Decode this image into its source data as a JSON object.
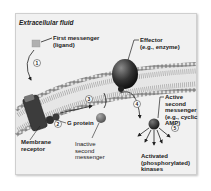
{
  "diagram": {
    "title": "Extracellular fluid",
    "labels": {
      "first_messenger": [
        "First messenger",
        "(ligand)"
      ],
      "effector": [
        "Effector",
        "(e.g., enzyme)"
      ],
      "g_protein": "G protein",
      "membrane_receptor": [
        "Membrane",
        "receptor"
      ],
      "inactive_second_messenger": [
        "Inactive",
        "second",
        "messenger"
      ],
      "active_second_messenger": [
        "Active",
        "second",
        "messenger",
        "(e.g., cyclic",
        "AMP)"
      ],
      "activated_kinases": [
        "Activated",
        "(phosphorylated)",
        "kinases"
      ]
    },
    "steps": [
      "1",
      "2",
      "3",
      "4",
      "5"
    ],
    "colors": {
      "background": "#f1f1f1",
      "membrane_head": "#8a8a8a",
      "receptor": "#3c3c3c",
      "effector": "#2e2e2e",
      "ligand": "#b0b0b0",
      "second_messenger_inactive": "#7a7a7a",
      "second_messenger_active": "#2a2a2a"
    }
  }
}
